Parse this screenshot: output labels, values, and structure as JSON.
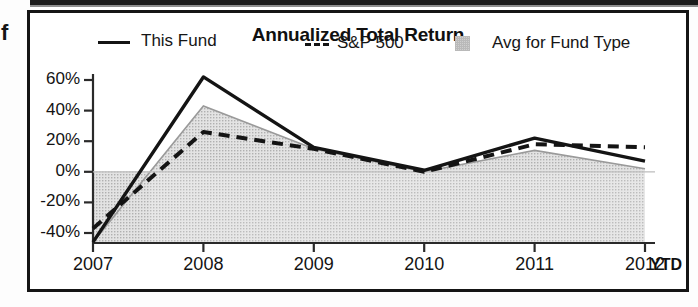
{
  "stray_text": "f",
  "chart": {
    "title": "Annualized Total Return",
    "x_axis_suffix": "YTD",
    "legend": [
      {
        "label": "This Fund",
        "marker": "solid-line",
        "color": "#141414"
      },
      {
        "label": "S&P 500",
        "marker": "dashed-line",
        "color": "#141414"
      },
      {
        "label": "Avg for Fund Type",
        "marker": "filled-area",
        "color": "#cfcfcf"
      }
    ]
  },
  "chart_data": {
    "type": "line",
    "title": "Annualized Total Return",
    "xlabel": "",
    "ylabel": "",
    "x": [
      "2007",
      "2008",
      "2009",
      "2010",
      "2011",
      "2012"
    ],
    "categories": [
      "2007",
      "2008",
      "2009",
      "2010",
      "2011",
      "2012"
    ],
    "tick_labels_y": [
      "60%",
      "40%",
      "20%",
      "0%",
      "-20%",
      "-40%"
    ],
    "ytick_values": [
      60,
      40,
      20,
      0,
      -20,
      -40
    ],
    "ylim": [
      -50,
      65
    ],
    "grid": false,
    "legend_position": "top",
    "x_axis_note": "2012 YTD",
    "series": [
      {
        "name": "This Fund",
        "style": "solid",
        "color": "#141414",
        "values": [
          -46,
          62,
          16,
          1,
          22,
          7
        ]
      },
      {
        "name": "S&P 500",
        "style": "dashed",
        "color": "#141414",
        "values": [
          -37,
          26,
          15,
          0,
          18,
          16
        ]
      },
      {
        "name": "Avg for Fund Type",
        "style": "area",
        "color": "#cfcfcf",
        "values": [
          -46,
          43,
          15,
          0,
          14,
          2
        ]
      }
    ]
  }
}
